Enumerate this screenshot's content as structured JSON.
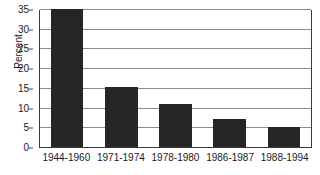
{
  "chart_data": {
    "type": "bar",
    "title": "",
    "xlabel": "",
    "ylabel": "Percent",
    "ylim": [
      0,
      35
    ],
    "ytick_step": 5,
    "yticks": [
      35,
      30,
      25,
      20,
      15,
      10,
      5,
      0
    ],
    "grid": true,
    "legend": "none",
    "categories": [
      "1944-1960",
      "1971-1974",
      "1978-1980",
      "1986-1987",
      "1988-1994"
    ],
    "values": [
      35,
      15.2,
      11,
      7,
      5.2
    ],
    "colors": {
      "bar": "#262626",
      "gridline": "#8c8c8c",
      "axis": "#3a3a3a",
      "background": "#ffffff",
      "text": "#1a1a1a"
    }
  }
}
